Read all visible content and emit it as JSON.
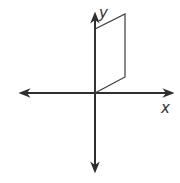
{
  "diagram": {
    "type": "coordinate-plane-with-parallelogram",
    "colors": {
      "background": "#ffffff",
      "stroke": "#2f2f2f",
      "label": "#333333"
    },
    "axes": {
      "origin": [
        95,
        93
      ],
      "x_axis": {
        "label": "x",
        "from": [
          19,
          93
        ],
        "to": [
          174,
          93
        ]
      },
      "y_axis": {
        "label": "y",
        "from": [
          95,
          173
        ],
        "to": [
          95,
          12
        ]
      }
    },
    "shape": {
      "name": "parallelogram",
      "vertices": [
        [
          95,
          29
        ],
        [
          125,
          14
        ],
        [
          125,
          77
        ],
        [
          95,
          93
        ]
      ]
    }
  }
}
